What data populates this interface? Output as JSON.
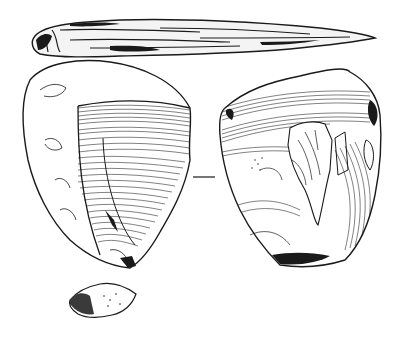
{
  "figure": {
    "views": [
      {
        "name": "profile-view",
        "label": "side profile"
      },
      {
        "name": "dorsal-view",
        "label": "dorsal face"
      },
      {
        "name": "ventral-view",
        "label": "ventral face"
      },
      {
        "name": "platform-view",
        "label": "striking platform"
      }
    ],
    "colors": {
      "ink": "#1a1a1a",
      "paper": "#ffffff"
    }
  }
}
